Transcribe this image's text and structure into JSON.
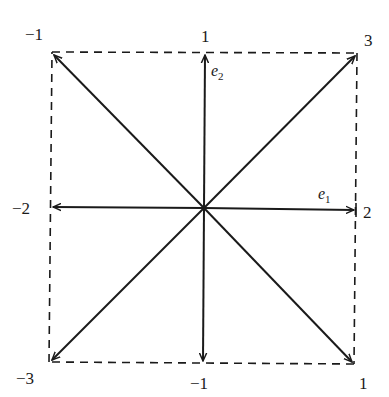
{
  "diagram": {
    "basis_labels": {
      "e1": {
        "base": "e",
        "sub": "1"
      },
      "e2": {
        "base": "e",
        "sub": "2"
      }
    },
    "points": [
      {
        "id": "top-left",
        "label": "−1"
      },
      {
        "id": "top-mid",
        "label": "1"
      },
      {
        "id": "top-right",
        "label": "3"
      },
      {
        "id": "mid-left",
        "label": "−2"
      },
      {
        "id": "mid-right",
        "label": "2"
      },
      {
        "id": "bottom-left",
        "label": "−3"
      },
      {
        "id": "bottom-mid",
        "label": "−1"
      },
      {
        "id": "bottom-right",
        "label": "1"
      }
    ],
    "colors": {
      "stroke": "#1a1a1a",
      "background": "#ffffff"
    }
  }
}
